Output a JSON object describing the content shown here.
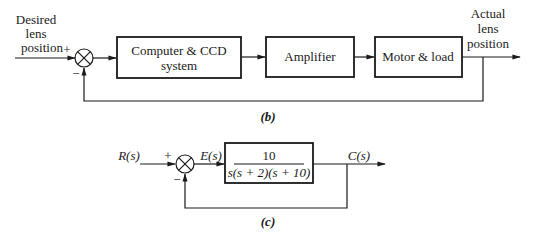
{
  "diagram_b": {
    "caption": "(b)",
    "input_label": [
      "Desired",
      "lens",
      "position"
    ],
    "output_label": [
      "Actual",
      "lens",
      "position"
    ],
    "sum_plus": "+",
    "sum_minus": "−",
    "blocks": [
      {
        "label": [
          "Computer & CCD",
          "system"
        ]
      },
      {
        "label": [
          "Amplifier"
        ]
      },
      {
        "label": [
          "Motor & load"
        ]
      }
    ]
  },
  "diagram_c": {
    "caption": "(c)",
    "input_label": "R(s)",
    "error_label": "E(s)",
    "output_label": "C(s)",
    "sum_plus": "+",
    "sum_minus": "−",
    "transfer_function": {
      "numerator": "10",
      "denominator": "s(s + 2)(s + 10)"
    }
  }
}
